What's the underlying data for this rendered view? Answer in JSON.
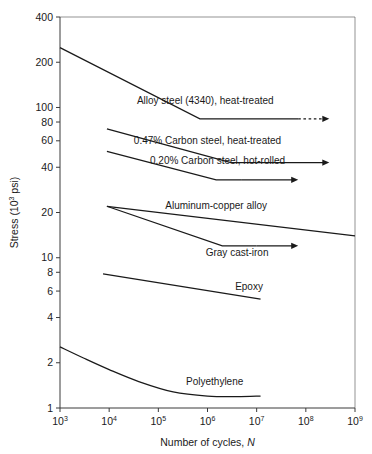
{
  "figure": {
    "name": "fatigue-s-n-curves",
    "background_color": "#ffffff",
    "line_color": "#1a1a1a",
    "axis_color": "#3b3b3b"
  },
  "chart_data": {
    "type": "line",
    "title": "",
    "subtitle": "",
    "xlabel_prefix": "Number of cycles, ",
    "xlabel_symbol": "N",
    "ylabel_prefix": "Stress (10",
    "ylabel_sup": "3",
    "ylabel_suffix": " psi)",
    "xscale": "log",
    "yscale": "log",
    "xlim": [
      1000,
      1000000000
    ],
    "ylim": [
      1,
      400
    ],
    "grid": false,
    "legend": "inline-annotations",
    "xticks": [
      {
        "base": "10",
        "exp": "3",
        "value": 1000
      },
      {
        "base": "10",
        "exp": "4",
        "value": 10000
      },
      {
        "base": "10",
        "exp": "5",
        "value": 100000
      },
      {
        "base": "10",
        "exp": "6",
        "value": 1000000
      },
      {
        "base": "10",
        "exp": "7",
        "value": 10000000
      },
      {
        "base": "10",
        "exp": "8",
        "value": 100000000
      },
      {
        "base": "10",
        "exp": "9",
        "value": 1000000000
      }
    ],
    "yticks": [
      {
        "label": "400",
        "value": 400
      },
      {
        "label": "200",
        "value": 200
      },
      {
        "label": "100",
        "value": 100
      },
      {
        "label": "80",
        "value": 80
      },
      {
        "label": "60",
        "value": 60
      },
      {
        "label": "40",
        "value": 40
      },
      {
        "label": "20",
        "value": 20
      },
      {
        "label": "10",
        "value": 10
      },
      {
        "label": "8",
        "value": 8
      },
      {
        "label": "6",
        "value": 6
      },
      {
        "label": "4",
        "value": 4
      },
      {
        "label": "2",
        "value": 2
      },
      {
        "label": "1",
        "value": 1
      }
    ],
    "series": [
      {
        "name": "Alloy steel (4340), heat-treated",
        "label": "Alloy steel (4340), heat-treated",
        "has_arrow": true,
        "arrow_style": "dashed",
        "points": [
          {
            "x": 1000,
            "y": 250
          },
          {
            "x": 700000,
            "y": 84
          },
          {
            "x": 70000000,
            "y": 84
          }
        ],
        "arrow_to_x": 300000000,
        "label_anchor": {
          "x": 900000,
          "y": 105
        }
      },
      {
        "name": "0.47% Carbon steel, heat-treated",
        "label": "0.47% Carbon steel, heat-treated",
        "has_arrow": true,
        "arrow_style": "solid",
        "points": [
          {
            "x": 9000,
            "y": 72
          },
          {
            "x": 3000000,
            "y": 43
          },
          {
            "x": 10000000,
            "y": 43
          }
        ],
        "arrow_to_x": 300000000,
        "label_anchor": {
          "x": 1000000,
          "y": 57
        }
      },
      {
        "name": "0.20% Carbon steel, hot-rolled",
        "label": "0.20% Carbon steel, hot-rolled",
        "has_arrow": true,
        "arrow_style": "solid",
        "points": [
          {
            "x": 9000,
            "y": 51
          },
          {
            "x": 1500000,
            "y": 33
          },
          {
            "x": 5000000,
            "y": 33
          }
        ],
        "arrow_to_x": 70000000,
        "label_anchor": {
          "x": 1600000,
          "y": 42
        }
      },
      {
        "name": "Aluminum-copper alloy",
        "label": "Aluminum-copper alloy",
        "has_arrow": false,
        "arrow_style": "none",
        "points": [
          {
            "x": 9000,
            "y": 22
          },
          {
            "x": 1000000000,
            "y": 14
          }
        ],
        "label_anchor": {
          "x": 1500000,
          "y": 21
        }
      },
      {
        "name": "Gray cast-iron",
        "label": "Gray cast-iron",
        "has_arrow": true,
        "arrow_style": "solid",
        "points": [
          {
            "x": 9000,
            "y": 22
          },
          {
            "x": 2000000,
            "y": 12
          },
          {
            "x": 10000000,
            "y": 12
          }
        ],
        "arrow_to_x": 70000000,
        "label_anchor": {
          "x": 4000000,
          "y": 10.3
        }
      },
      {
        "name": "Epoxy",
        "label": "Epoxy",
        "has_arrow": false,
        "arrow_style": "none",
        "points": [
          {
            "x": 7500,
            "y": 7.8
          },
          {
            "x": 12000000,
            "y": 5.3
          }
        ],
        "label_anchor": {
          "x": 7000000,
          "y": 6.1
        }
      },
      {
        "name": "Polyethylene",
        "label": "Polyethylene",
        "has_arrow": false,
        "arrow_style": "none",
        "points": [
          {
            "x": 1000,
            "y": 2.55
          },
          {
            "x": 3000,
            "y": 2.15
          },
          {
            "x": 10000,
            "y": 1.8
          },
          {
            "x": 40000,
            "y": 1.5
          },
          {
            "x": 200000,
            "y": 1.28
          },
          {
            "x": 1000000,
            "y": 1.2
          },
          {
            "x": 4000000,
            "y": 1.19
          },
          {
            "x": 12000000,
            "y": 1.2
          }
        ],
        "label_anchor": {
          "x": 1400000,
          "y": 1.42
        }
      }
    ]
  }
}
